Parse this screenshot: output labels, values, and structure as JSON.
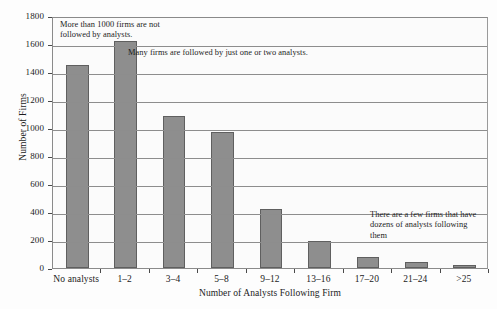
{
  "chart_data": {
    "type": "bar",
    "title": "",
    "xlabel": "Number of Analysts Following Firm",
    "ylabel": "Number of Firms",
    "categories": [
      "No analysts",
      "1–2",
      "3–4",
      "5–8",
      "9–12",
      "13–16",
      "17–20",
      "21–24",
      ">25"
    ],
    "values": [
      1450,
      1620,
      1085,
      975,
      420,
      195,
      80,
      45,
      20
    ],
    "ylim": [
      0,
      1800
    ],
    "yticks": [
      0,
      200,
      400,
      600,
      800,
      1000,
      1200,
      1400,
      1600,
      1800
    ],
    "ytick_labels": [
      "0",
      "200",
      "400",
      "600",
      "800",
      "1000",
      "1200",
      "1400",
      "1600",
      "1800"
    ],
    "grid": true,
    "legend": "none",
    "bar_color": "#8e8e8e",
    "bar_edge_color": "#5f5f5f",
    "frame_color": "#8a8a8a",
    "annotations": [
      "More than 1000 firms are not followed by analysts.",
      "Many firms are followed by just one or two analysts.",
      "There are a few firms that have dozens of analysts following them"
    ]
  },
  "caption": ""
}
